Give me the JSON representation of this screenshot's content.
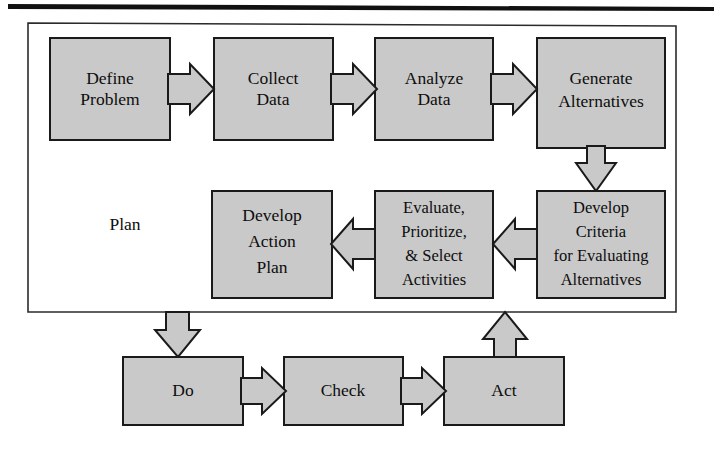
{
  "diagram": {
    "container_label": "Plan",
    "colors": {
      "box_fill": "#c9c9c9",
      "box_stroke": "#1a1a1a",
      "frame_stroke": "#2b2b2b",
      "text": "#0d0d0d",
      "page_background": "#ffffff"
    },
    "top_row": [
      {
        "id": "define-problem",
        "lines": [
          "Define",
          "Problem"
        ]
      },
      {
        "id": "collect-data",
        "lines": [
          "Collect",
          "Data"
        ]
      },
      {
        "id": "analyze-data",
        "lines": [
          "Analyze",
          "Data"
        ]
      },
      {
        "id": "generate-alternatives",
        "lines": [
          "Generate",
          "Alternatives"
        ]
      }
    ],
    "middle_row": [
      {
        "id": "develop-action-plan",
        "lines": [
          "Develop",
          "Action",
          "Plan"
        ]
      },
      {
        "id": "evaluate-prioritize-select",
        "lines": [
          "Evaluate,",
          "Prioritize,",
          "& Select",
          "Activities"
        ]
      },
      {
        "id": "develop-criteria",
        "lines": [
          "Develop",
          "Criteria",
          "for Evaluating",
          "Alternatives"
        ]
      }
    ],
    "bottom_row": [
      {
        "id": "do",
        "lines": [
          "Do"
        ]
      },
      {
        "id": "check",
        "lines": [
          "Check"
        ]
      },
      {
        "id": "act",
        "lines": [
          "Act"
        ]
      }
    ],
    "connectors": [
      {
        "id": "define-to-collect",
        "direction": "right"
      },
      {
        "id": "collect-to-analyze",
        "direction": "right"
      },
      {
        "id": "analyze-to-generate",
        "direction": "right"
      },
      {
        "id": "generate-to-criteria",
        "direction": "down"
      },
      {
        "id": "criteria-to-evaluate",
        "direction": "left"
      },
      {
        "id": "evaluate-to-action-plan",
        "direction": "left"
      },
      {
        "id": "plan-to-do",
        "direction": "down"
      },
      {
        "id": "do-to-check",
        "direction": "right"
      },
      {
        "id": "check-to-act",
        "direction": "right"
      },
      {
        "id": "act-to-plan",
        "direction": "up"
      }
    ]
  }
}
